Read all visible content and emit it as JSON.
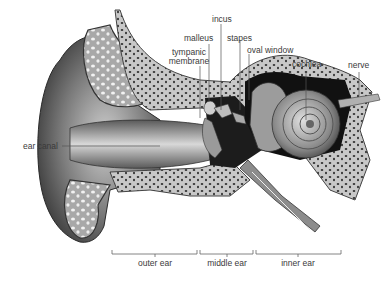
{
  "diagram": {
    "labels": {
      "incus": "incus",
      "malleus": "malleus",
      "tympanic_membrane_line1": "tympanic",
      "tympanic_membrane_line2": "membrane",
      "stapes": "stapes",
      "oval_window": "oval window",
      "cochlea": "cochlea",
      "nerve": "nerve",
      "ear_canal": "ear canal"
    },
    "regions": [
      {
        "label": "outer ear"
      },
      {
        "label": "middle ear"
      },
      {
        "label": "inner ear"
      }
    ],
    "colors": {
      "background": "#ffffff",
      "skin_dark": "#4a4a4a",
      "skin_mid": "#8a8a8a",
      "cartilage": "#b8b8b8",
      "bone": "#c9c9c9",
      "bone_spots": "#3a3a3a",
      "cavity": "#1a1a1a",
      "leader_line": "#555555"
    }
  }
}
